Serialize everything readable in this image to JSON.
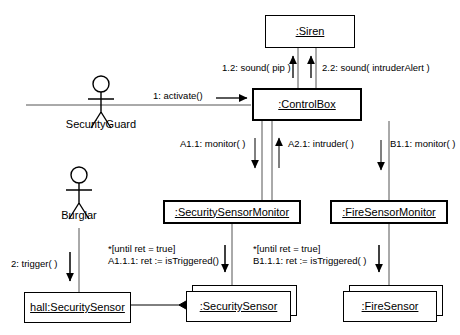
{
  "diagram": {
    "type": "uml-communication-diagram"
  },
  "actors": {
    "security_guard": {
      "label": "SecurityGuard"
    },
    "burglar": {
      "label": "Burglar"
    }
  },
  "objects": {
    "siren": {
      "label": ":Siren"
    },
    "control_box": {
      "label": ":ControlBox"
    },
    "security_sensor_monitor": {
      "label": ":SecuritySensorMonitor"
    },
    "fire_sensor_monitor": {
      "label": ":FireSensorMonitor"
    },
    "hall_security_sensor": {
      "label": "hall:SecuritySensor"
    },
    "security_sensor": {
      "label": ":SecuritySensor"
    },
    "fire_sensor": {
      "label": ":FireSensor"
    }
  },
  "messages": {
    "m1_activate": "1: activate()",
    "m1_2_sound_pip": "1.2: sound( pip )",
    "m2_2_sound_intruder": "2.2: sound( intruderAlert )",
    "m_a1_1_monitor": "A1.1: monitor( )",
    "m_a2_1_intruder": "A2.1: intruder( )",
    "m_b1_1_monitor": "B1.1: monitor( )",
    "m2_trigger": "2: trigger( )",
    "m_a1_1_1_guard": "*[until ret = true]",
    "m_a1_1_1": "A1.1.1: ret := isTriggered()",
    "m_b1_1_1_guard": "*[until ret = true]",
    "m_b1_1_1": "B1.1.1: ret := isTriggered( )"
  },
  "colors": {
    "stroke": "#000000",
    "background": "#ffffff",
    "text": "#000000"
  }
}
